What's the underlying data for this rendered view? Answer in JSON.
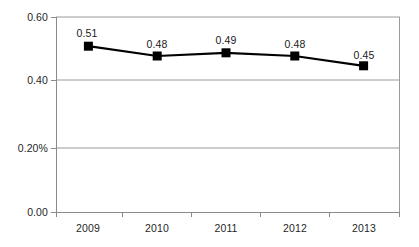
{
  "chart_data": {
    "type": "line",
    "title": "",
    "subtitle": "",
    "xlabel": "",
    "ylabel": "",
    "categories": [
      "2009",
      "2010",
      "2011",
      "2012",
      "2013"
    ],
    "values": [
      0.51,
      0.48,
      0.49,
      0.48,
      0.45
    ],
    "point_labels": [
      "0.51",
      "0.48",
      "0.49",
      "0.48",
      "0.45"
    ],
    "ylim": [
      0.0,
      0.6
    ],
    "ytick_values": [
      0.6,
      0.4,
      0.2,
      0.0
    ],
    "ytick_labels": [
      "0.60",
      "0.40",
      "0.20%",
      "0.00"
    ],
    "grid": true,
    "legend": false,
    "legend_position": "none",
    "marker": "square",
    "series": [
      {
        "name": "",
        "values": [
          0.51,
          0.48,
          0.49,
          0.48,
          0.45
        ]
      }
    ],
    "colors": {
      "line": "#000000",
      "marker": "#000000",
      "grid": "#a6a6a6",
      "axis": "#808080",
      "text": "#1a1a1a",
      "background": "#ffffff"
    }
  }
}
